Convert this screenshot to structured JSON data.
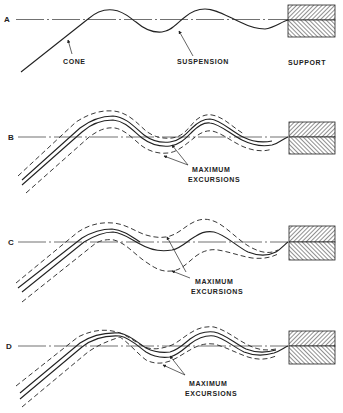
{
  "figure": {
    "panels": [
      {
        "id": "A",
        "label": "A",
        "annotations": {
          "cone": "CONE",
          "suspension": "SUSPENSION",
          "support": "SUPPORT"
        }
      },
      {
        "id": "B",
        "label": "B",
        "annotations": {
          "excursions_line1": "MAXIMUM",
          "excursions_line2": "EXCURSIONS"
        }
      },
      {
        "id": "C",
        "label": "C",
        "annotations": {
          "excursions_line1": "MAXIMUM",
          "excursions_line2": "EXCURSIONS"
        }
      },
      {
        "id": "D",
        "label": "D",
        "annotations": {
          "excursions_line1": "MAXIMUM",
          "excursions_line2": "EXCURSIONS"
        }
      }
    ],
    "colors": {
      "ink": "#222222",
      "background": "#ffffff"
    }
  }
}
